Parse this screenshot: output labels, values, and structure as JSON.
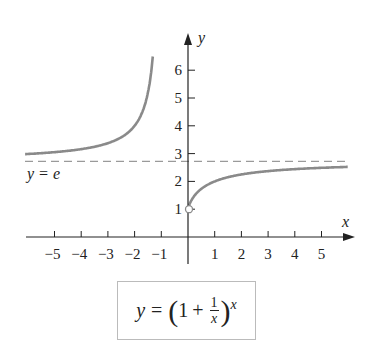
{
  "chart_data": {
    "type": "line",
    "title": "",
    "function": "y = (1 + 1/x)^x",
    "xlabel": "x",
    "ylabel": "y",
    "x_ticks": [
      -5,
      -4,
      -3,
      -2,
      -1,
      1,
      2,
      3,
      4,
      5
    ],
    "y_ticks": [
      1,
      2,
      3,
      4,
      5,
      6
    ],
    "xlim": [
      -6,
      6
    ],
    "ylim": [
      0,
      6.7
    ],
    "asymptote": {
      "label": "y = e",
      "value": 2.718,
      "style": "dashed"
    },
    "open_point": {
      "x": 0,
      "y": 1
    },
    "series": [
      {
        "name": "left branch (x < -1)",
        "x": [
          -6,
          -5,
          -4,
          -3,
          -2,
          -1.5,
          -1.2
        ],
        "y": [
          2.99,
          3.05,
          3.16,
          3.38,
          4.0,
          5.2,
          6.6
        ]
      },
      {
        "name": "right branch (x > 0)",
        "x": [
          0,
          0.25,
          0.5,
          1,
          2,
          3,
          4,
          5,
          6
        ],
        "y": [
          1,
          1.5,
          1.73,
          2.0,
          2.25,
          2.37,
          2.44,
          2.49,
          2.52
        ]
      }
    ],
    "grid": false
  },
  "labels": {
    "x_axis": "x",
    "y_axis": "y",
    "asymptote_y": "y",
    "asymptote_eq": "=",
    "asymptote_e": "e",
    "formula_y": "y",
    "formula_eq": "=",
    "formula_one": "1",
    "formula_plus": "+",
    "formula_num": "1",
    "formula_den": "x",
    "formula_exp": "x",
    "paren_open": "(",
    "paren_close": ")"
  },
  "colors": {
    "curve": "#8a8a8a",
    "axis": "#222222",
    "dashed": "#9a9a9a"
  }
}
